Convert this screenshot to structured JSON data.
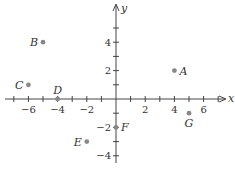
{
  "chart_data": {
    "type": "scatter",
    "title": "",
    "xlabel": "x",
    "ylabel": "y",
    "xlim": [
      -7.5,
      7.5
    ],
    "ylim": [
      -5,
      6
    ],
    "grid": false,
    "x_ticks": [
      -6,
      -4,
      -2,
      2,
      4,
      6
    ],
    "y_ticks": [
      -4,
      -2,
      2,
      4
    ],
    "points": [
      {
        "label": "A",
        "x": 4,
        "y": 2,
        "label_pos": "right"
      },
      {
        "label": "B",
        "x": -5,
        "y": 4,
        "label_pos": "left"
      },
      {
        "label": "C",
        "x": -6,
        "y": 1,
        "label_pos": "left"
      },
      {
        "label": "D",
        "x": -4,
        "y": 0,
        "label_pos": "above"
      },
      {
        "label": "E",
        "x": -2,
        "y": -3,
        "label_pos": "left"
      },
      {
        "label": "F",
        "x": 0,
        "y": -2,
        "label_pos": "right"
      },
      {
        "label": "G",
        "x": 5,
        "y": -1,
        "label_pos": "below"
      }
    ],
    "colors": {
      "axis": "#444444",
      "point": "#888888",
      "text": "#333333"
    }
  }
}
